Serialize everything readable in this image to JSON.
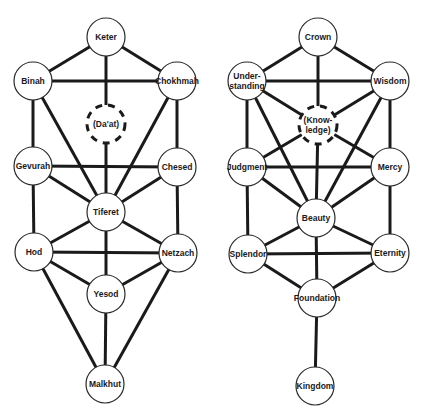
{
  "diagram": {
    "colors": {
      "line": "#1a1a1a",
      "node_fill": "#ffffff",
      "node_stroke": "#2a2a2a",
      "background": "#ffffff"
    },
    "node_radius": 19,
    "trees": [
      {
        "id": "hebrew",
        "nodes": [
          {
            "id": "keter",
            "lines": [
              "Keter"
            ],
            "x": 106,
            "y": 37
          },
          {
            "id": "binah",
            "lines": [
              "Binah"
            ],
            "x": 33,
            "y": 81
          },
          {
            "id": "chokhmah",
            "lines": [
              "Chokhmah"
            ],
            "x": 177,
            "y": 81
          },
          {
            "id": "daat",
            "lines": [
              "(Da'at)"
            ],
            "x": 106,
            "y": 124,
            "dashed": true
          },
          {
            "id": "gevurah",
            "lines": [
              "Gevurah"
            ],
            "x": 33,
            "y": 166
          },
          {
            "id": "chesed",
            "lines": [
              "Chesed"
            ],
            "x": 177,
            "y": 167
          },
          {
            "id": "tiferet",
            "lines": [
              "Tiferet"
            ],
            "x": 106,
            "y": 212
          },
          {
            "id": "hod",
            "lines": [
              "Hod"
            ],
            "x": 34,
            "y": 252
          },
          {
            "id": "netzach",
            "lines": [
              "Netzach"
            ],
            "x": 178,
            "y": 253
          },
          {
            "id": "yesod",
            "lines": [
              "Yesod"
            ],
            "x": 106,
            "y": 294
          },
          {
            "id": "malkhut",
            "lines": [
              "Malkhut"
            ],
            "x": 105,
            "y": 384
          }
        ],
        "edges": [
          [
            "keter",
            "binah"
          ],
          [
            "keter",
            "chokhmah"
          ],
          [
            "keter",
            "daat"
          ],
          [
            "binah",
            "chokhmah"
          ],
          [
            "binah",
            "gevurah"
          ],
          [
            "binah",
            "tiferet"
          ],
          [
            "chokhmah",
            "chesed"
          ],
          [
            "chokhmah",
            "tiferet"
          ],
          [
            "daat",
            "tiferet"
          ],
          [
            "gevurah",
            "chesed"
          ],
          [
            "gevurah",
            "tiferet"
          ],
          [
            "gevurah",
            "hod"
          ],
          [
            "chesed",
            "tiferet"
          ],
          [
            "chesed",
            "netzach"
          ],
          [
            "tiferet",
            "hod"
          ],
          [
            "tiferet",
            "netzach"
          ],
          [
            "tiferet",
            "yesod"
          ],
          [
            "hod",
            "netzach"
          ],
          [
            "hod",
            "yesod"
          ],
          [
            "hod",
            "malkhut"
          ],
          [
            "netzach",
            "yesod"
          ],
          [
            "netzach",
            "malkhut"
          ],
          [
            "yesod",
            "malkhut"
          ]
        ]
      },
      {
        "id": "english",
        "nodes": [
          {
            "id": "crown",
            "lines": [
              "Crown"
            ],
            "x": 318,
            "y": 37
          },
          {
            "id": "understanding",
            "lines": [
              "Under-",
              "standing"
            ],
            "x": 247,
            "y": 81
          },
          {
            "id": "wisdom",
            "lines": [
              "Wisdom"
            ],
            "x": 390,
            "y": 81
          },
          {
            "id": "knowledge",
            "lines": [
              "(Know-",
              "ledge)"
            ],
            "x": 318,
            "y": 125,
            "dashed": true
          },
          {
            "id": "judgment",
            "lines": [
              "Judgment"
            ],
            "x": 247,
            "y": 167
          },
          {
            "id": "mercy",
            "lines": [
              "Mercy"
            ],
            "x": 390,
            "y": 167
          },
          {
            "id": "beauty",
            "lines": [
              "Beauty"
            ],
            "x": 316,
            "y": 218
          },
          {
            "id": "splendor",
            "lines": [
              "Splendor"
            ],
            "x": 248,
            "y": 254
          },
          {
            "id": "eternity",
            "lines": [
              "Eternity"
            ],
            "x": 390,
            "y": 253
          },
          {
            "id": "foundation",
            "lines": [
              "Foundation"
            ],
            "x": 317,
            "y": 298
          },
          {
            "id": "kingdom",
            "lines": [
              "Kingdom"
            ],
            "x": 315,
            "y": 386
          }
        ],
        "edges": [
          [
            "crown",
            "understanding"
          ],
          [
            "crown",
            "wisdom"
          ],
          [
            "crown",
            "knowledge"
          ],
          [
            "understanding",
            "wisdom"
          ],
          [
            "understanding",
            "judgment"
          ],
          [
            "understanding",
            "beauty"
          ],
          [
            "understanding",
            "knowledge"
          ],
          [
            "wisdom",
            "mercy"
          ],
          [
            "wisdom",
            "beauty"
          ],
          [
            "wisdom",
            "knowledge"
          ],
          [
            "knowledge",
            "beauty"
          ],
          [
            "knowledge",
            "judgment"
          ],
          [
            "knowledge",
            "mercy"
          ],
          [
            "judgment",
            "mercy"
          ],
          [
            "judgment",
            "beauty"
          ],
          [
            "judgment",
            "splendor"
          ],
          [
            "mercy",
            "beauty"
          ],
          [
            "mercy",
            "eternity"
          ],
          [
            "beauty",
            "splendor"
          ],
          [
            "beauty",
            "eternity"
          ],
          [
            "beauty",
            "foundation"
          ],
          [
            "splendor",
            "eternity"
          ],
          [
            "splendor",
            "foundation"
          ],
          [
            "eternity",
            "foundation"
          ],
          [
            "foundation",
            "kingdom"
          ]
        ]
      }
    ]
  }
}
